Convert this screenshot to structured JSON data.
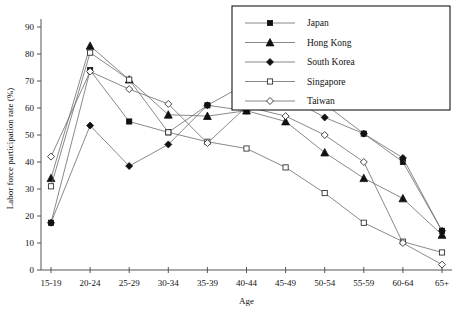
{
  "chart_data": {
    "type": "line",
    "title": "",
    "xlabel": "Age",
    "ylabel": "Labor force participation rate (%)",
    "ylim": [
      0,
      90
    ],
    "yticks": [
      0,
      10,
      20,
      30,
      40,
      50,
      60,
      70,
      80,
      90
    ],
    "grid": false,
    "legend_position": "top-right",
    "categories": [
      "15-19",
      "20-24",
      "25-29",
      "30-34",
      "35-39",
      "40-44",
      "45-49",
      "50-54",
      "55-59",
      "60-64",
      "65+"
    ],
    "series": [
      {
        "name": "Japan",
        "marker": "filled-square",
        "values": [
          17.5,
          74.0,
          55.0,
          51.0,
          61.0,
          69.0,
          69.0,
          61.5,
          50.5,
          40.0,
          14.5
        ]
      },
      {
        "name": "Hong Kong",
        "marker": "filled-triangle",
        "values": [
          34.0,
          83.0,
          70.5,
          57.5,
          57.0,
          59.0,
          55.0,
          43.5,
          34.0,
          26.5,
          13.0
        ]
      },
      {
        "name": "South Korea",
        "marker": "filled-diamond",
        "values": [
          17.5,
          53.5,
          38.5,
          46.5,
          61.0,
          59.0,
          64.5,
          56.5,
          50.5,
          41.5,
          14.5
        ]
      },
      {
        "name": "Singapore",
        "marker": "open-square",
        "values": [
          31.0,
          80.5,
          70.5,
          51.0,
          47.5,
          45.0,
          38.0,
          28.5,
          17.5,
          10.5,
          6.5
        ]
      },
      {
        "name": "Taiwan",
        "marker": "open-diamond",
        "values": [
          42.0,
          73.5,
          67.0,
          61.5,
          47.0,
          60.5,
          57.0,
          50.0,
          40.0,
          10.0,
          2.0
        ]
      }
    ]
  },
  "legend": {
    "items": [
      {
        "label": "Japan"
      },
      {
        "label": "Hong Kong"
      },
      {
        "label": "South Korea"
      },
      {
        "label": "Singapore"
      },
      {
        "label": "Taiwan"
      }
    ]
  },
  "colors": {
    "line": "#6b6b6b",
    "marker_fill": "#111111",
    "marker_open": "#ffffff",
    "axis": "#555555",
    "text": "#111111",
    "background": "#ffffff"
  }
}
